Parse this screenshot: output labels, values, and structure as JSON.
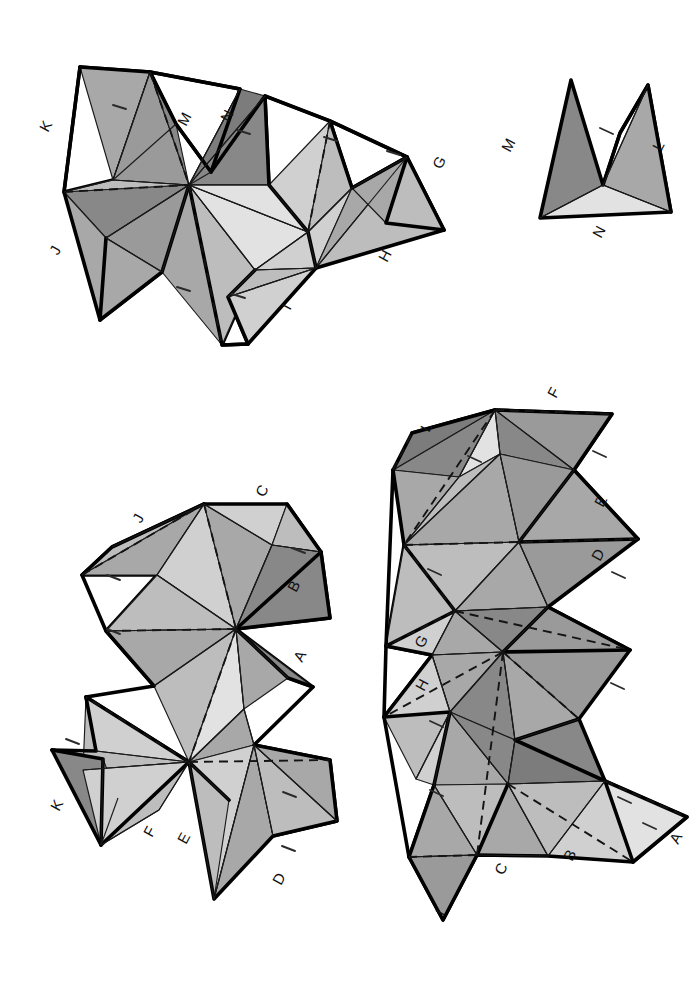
{
  "document": {
    "kind": "polyhedron-net-template",
    "sheet_width": 692,
    "sheet_height": 985,
    "background": "#ffffff",
    "ink": "#000000"
  },
  "palette": {
    "white": "#ffffff",
    "light": "#e2e2e2",
    "light2": "#d0d0d0",
    "mid_light": "#bdbdbd",
    "mid": "#a8a8a8",
    "mid_dark": "#9a9a9a",
    "dark": "#888888",
    "darker": "#7c7c7c",
    "outline": "#000000",
    "thin_line": "#1a1a1a"
  },
  "pieces": [
    {
      "id": "piece-top-left",
      "name": "Large zig-zag net (top left)",
      "labels": [
        "K",
        "M",
        "N",
        "G",
        "J",
        "H",
        "I"
      ]
    },
    {
      "id": "piece-top-right",
      "name": "Small triangular net (top right)",
      "labels": [
        "M",
        "L",
        "N"
      ]
    },
    {
      "id": "piece-bottom-left",
      "name": "Vertical antiprism net (bottom left)",
      "labels": [
        "C",
        "J",
        "B",
        "A",
        "K",
        "F",
        "E",
        "D"
      ]
    },
    {
      "id": "piece-bottom-right",
      "name": "Tall antiprism net (bottom right)",
      "labels": [
        "F",
        "L",
        "E",
        "D",
        "G",
        "H",
        "A",
        "B",
        "C",
        "I"
      ]
    }
  ],
  "labels": {
    "top_left": [
      {
        "text": "K",
        "x": 48,
        "y": 133,
        "rot": -62
      },
      {
        "text": "M",
        "x": 186,
        "y": 127,
        "rot": -62
      },
      {
        "text": "N",
        "x": 229,
        "y": 123,
        "rot": -62
      },
      {
        "text": "G",
        "x": 441,
        "y": 170,
        "rot": -62
      },
      {
        "text": "J",
        "x": 58,
        "y": 256,
        "rot": -62
      },
      {
        "text": "H",
        "x": 387,
        "y": 263,
        "rot": -62
      },
      {
        "text": "I",
        "x": 290,
        "y": 311,
        "rot": -62
      }
    ],
    "top_right": [
      {
        "text": "M",
        "x": 510,
        "y": 153,
        "rot": -62
      },
      {
        "text": "L",
        "x": 661,
        "y": 152,
        "rot": -62
      },
      {
        "text": "N",
        "x": 601,
        "y": 239,
        "rot": -62
      }
    ],
    "bottom_left": [
      {
        "text": "C",
        "x": 264,
        "y": 498,
        "rot": -62
      },
      {
        "text": "J",
        "x": 141,
        "y": 524,
        "rot": -62
      },
      {
        "text": "B",
        "x": 296,
        "y": 593,
        "rot": -62
      },
      {
        "text": "A",
        "x": 302,
        "y": 663,
        "rot": -62
      },
      {
        "text": "K",
        "x": 59,
        "y": 812,
        "rot": -62
      },
      {
        "text": "F",
        "x": 152,
        "y": 838,
        "rot": -62
      },
      {
        "text": "E",
        "x": 186,
        "y": 845,
        "rot": -62
      },
      {
        "text": "D",
        "x": 281,
        "y": 886,
        "rot": -62
      }
    ],
    "bottom_right": [
      {
        "text": "F",
        "x": 556,
        "y": 399,
        "rot": -62
      },
      {
        "text": "L",
        "x": 429,
        "y": 433,
        "rot": -62
      },
      {
        "text": "E",
        "x": 603,
        "y": 508,
        "rot": -62
      },
      {
        "text": "D",
        "x": 600,
        "y": 562,
        "rot": -62
      },
      {
        "text": "G",
        "x": 423,
        "y": 649,
        "rot": -62
      },
      {
        "text": "H",
        "x": 424,
        "y": 692,
        "rot": -62
      },
      {
        "text": "A",
        "x": 678,
        "y": 845,
        "rot": -62
      },
      {
        "text": "B",
        "x": 572,
        "y": 862,
        "rot": -62
      },
      {
        "text": "C",
        "x": 503,
        "y": 876,
        "rot": -62
      },
      {
        "text": "I",
        "x": 444,
        "y": 917,
        "rot": -62
      }
    ]
  },
  "fold_ticks": {
    "description": "short tick marks drawn on glue tabs indicating fold line",
    "top_left": [
      [
        120,
        107
      ],
      [
        243,
        132
      ],
      [
        330,
        139
      ],
      [
        393,
        153
      ],
      [
        183,
        289
      ],
      [
        238,
        296
      ]
    ],
    "top_right": [
      [
        606,
        131
      ]
    ],
    "bottom_left": [
      [
        298,
        551
      ],
      [
        113,
        578
      ],
      [
        113,
        632
      ],
      [
        289,
        795
      ],
      [
        288,
        849
      ],
      [
        72,
        742
      ]
    ],
    "bottom_right": [
      [
        599,
        454
      ],
      [
        474,
        459
      ],
      [
        434,
        572
      ],
      [
        618,
        575
      ],
      [
        617,
        686
      ],
      [
        436,
        724
      ],
      [
        436,
        793
      ],
      [
        624,
        800
      ],
      [
        630,
        826
      ]
    ]
  },
  "faces": {
    "top_left": [
      {
        "name": "tl-f01",
        "fill": "#a8a8a8",
        "pts": "80,67 150,72 113,180"
      },
      {
        "name": "tl-f02",
        "fill": "#bdbdbd",
        "pts": "113,180 150,72 176,124"
      },
      {
        "name": "tl-f03",
        "fill": "#888888",
        "pts": "150,72 189,185 176,124"
      },
      {
        "name": "tl-f04",
        "fill": "#9a9a9a",
        "pts": "150,72 189,185 113,180"
      },
      {
        "name": "tl-f05",
        "fill": "#bdbdbd",
        "pts": "113,180 189,185 64,192"
      },
      {
        "name": "tl-f06",
        "fill": "#888888",
        "pts": "64,192 189,185 106,238"
      },
      {
        "name": "tl-f07",
        "fill": "#a8a8a8",
        "pts": "64,192 106,238 100,320"
      },
      {
        "name": "tl-f08",
        "fill": "#9a9a9a",
        "pts": "106,238 189,185 162,272"
      },
      {
        "name": "tl-f09",
        "fill": "#a8a8a8",
        "pts": "106,238 162,272 100,320"
      },
      {
        "name": "tl-f10",
        "fill": "#a8a8a8",
        "pts": "162,272 189,185 222,345"
      },
      {
        "name": "tl-f11",
        "fill": "#bdbdbd",
        "pts": "189,185 255,270 222,345"
      },
      {
        "name": "tl-f12",
        "fill": "#888888",
        "pts": "189,185 240,89 211,172"
      },
      {
        "name": "tl-f13",
        "fill": "#7c7c7c",
        "pts": "189,185 265,96 240,89"
      },
      {
        "name": "tl-f14",
        "fill": "#888888",
        "pts": "189,185 265,96 269,185"
      },
      {
        "name": "tl-f15",
        "fill": "#bdbdbd",
        "pts": "189,185 269,185 255,270"
      },
      {
        "name": "tl-f16",
        "fill": "#e2e2e2",
        "pts": "189,185 255,270 308,232"
      },
      {
        "name": "tl-f17",
        "fill": "#d0d0d0",
        "pts": "255,270 308,232 316,268"
      },
      {
        "name": "tl-f18",
        "fill": "#e2e2e2",
        "pts": "189,185 308,232 269,185"
      },
      {
        "name": "tl-f19",
        "fill": "#d0d0d0",
        "pts": "269,185 308,232 330,121"
      },
      {
        "name": "tl-f20",
        "fill": "#bdbdbd",
        "pts": "308,232 330,121 352,188"
      },
      {
        "name": "tl-f21",
        "fill": "#d0d0d0",
        "pts": "308,232 352,188 316,268"
      },
      {
        "name": "tl-f22",
        "fill": "#a8a8a8",
        "pts": "316,268 352,188 407,157"
      },
      {
        "name": "tl-f23",
        "fill": "#bdbdbd",
        "pts": "316,268 407,157 444,230"
      },
      {
        "name": "tl-f24",
        "fill": "#a8a8a8",
        "pts": "352,188 407,157 386,223"
      },
      {
        "name": "tl-f25",
        "fill": "#bdbdbd",
        "pts": "255,270 316,268 228,297"
      },
      {
        "name": "tl-f26",
        "fill": "#d0d0d0",
        "pts": "228,297 316,268 248,344"
      }
    ],
    "top_right": [
      {
        "name": "tr-f01",
        "fill": "#888888",
        "pts": "571,80 603,185 540,218"
      },
      {
        "name": "tr-f02",
        "fill": "#a8a8a8",
        "pts": "603,185 648,85 671,212"
      },
      {
        "name": "tr-f03",
        "fill": "#e2e2e2",
        "pts": "540,218 603,185 671,212"
      },
      {
        "name": "tr-f04",
        "fill": "#bdbdbd",
        "pts": "603,185 648,85 620,133"
      }
    ],
    "bottom_left": [
      {
        "name": "bl-f01",
        "fill": "#bdbdbd",
        "pts": "204,504 112,547 82,575"
      },
      {
        "name": "bl-f02",
        "fill": "#a8a8a8",
        "pts": "204,504 82,575 157,575"
      },
      {
        "name": "bl-f03",
        "fill": "#d0d0d0",
        "pts": "204,504 157,575 236,629"
      },
      {
        "name": "bl-f04",
        "fill": "#a8a8a8",
        "pts": "204,504 236,629 272,545"
      },
      {
        "name": "bl-f05",
        "fill": "#d0d0d0",
        "pts": "204,504 272,545 287,504"
      },
      {
        "name": "bl-f06",
        "fill": "#bdbdbd",
        "pts": "272,545 287,504 321,552"
      },
      {
        "name": "bl-f07",
        "fill": "#888888",
        "pts": "272,545 321,552 236,629"
      },
      {
        "name": "bl-f08",
        "fill": "#888888",
        "pts": "236,629 321,552 330,618"
      },
      {
        "name": "bl-f09",
        "fill": "#bdbdbd",
        "pts": "157,575 236,629 106,631"
      },
      {
        "name": "bl-f10",
        "fill": "#a8a8a8",
        "pts": "106,631 236,629 154,686"
      },
      {
        "name": "bl-f11",
        "fill": "#bdbdbd",
        "pts": "154,686 236,629 189,762"
      },
      {
        "name": "bl-f12",
        "fill": "#e2e2e2",
        "pts": "236,629 189,762 244,709"
      },
      {
        "name": "bl-f13",
        "fill": "#a8a8a8",
        "pts": "236,629 244,709 288,678"
      },
      {
        "name": "bl-f14",
        "fill": "#888888",
        "pts": "236,629 288,678 313,687"
      },
      {
        "name": "bl-f15",
        "fill": "#a8a8a8",
        "pts": "189,762 244,709 254,745"
      },
      {
        "name": "bl-f16",
        "fill": "#d0d0d0",
        "pts": "189,762 254,745 189,762"
      },
      {
        "name": "bl-f17",
        "fill": "#bdbdbd",
        "pts": "86,697 189,762 83,770"
      },
      {
        "name": "bl-f18",
        "fill": "#d0d0d0",
        "pts": "86,697 189,762 96,751"
      },
      {
        "name": "bl-f19",
        "fill": "#bdbdbd",
        "pts": "96,751 189,762 83,770"
      },
      {
        "name": "bl-f20",
        "fill": "#888888",
        "pts": "52,750 103,759 101,845"
      },
      {
        "name": "bl-f21",
        "fill": "#a8a8a8",
        "pts": "103,759 101,845 118,798"
      },
      {
        "name": "bl-f22",
        "fill": "#d0d0d0",
        "pts": "83,770 189,762 101,845"
      },
      {
        "name": "bl-f23",
        "fill": "#bdbdbd",
        "pts": "101,845 189,762 159,810"
      },
      {
        "name": "bl-f24",
        "fill": "#d0d0d0",
        "pts": "189,762 254,745 214,899"
      },
      {
        "name": "bl-f25",
        "fill": "#bdbdbd",
        "pts": "189,762 214,899 229,800"
      },
      {
        "name": "bl-f26",
        "fill": "#a8a8a8",
        "pts": "214,899 254,745 273,836"
      },
      {
        "name": "bl-f27",
        "fill": "#bdbdbd",
        "pts": "254,745 273,836 337,821"
      },
      {
        "name": "bl-f28",
        "fill": "#a8a8a8",
        "pts": "254,745 337,821 330,760"
      }
    ],
    "bottom_right": [
      {
        "name": "br-f01",
        "fill": "#9a9a9a",
        "pts": "495,410 612,414 574,470"
      },
      {
        "name": "br-f02",
        "fill": "#888888",
        "pts": "495,410 574,470 500,454"
      },
      {
        "name": "br-f03",
        "fill": "#e2e2e2",
        "pts": "495,410 500,454 459,477"
      },
      {
        "name": "br-f04",
        "fill": "#888888",
        "pts": "495,410 459,477 393,470"
      },
      {
        "name": "br-f05",
        "fill": "#7c7c7c",
        "pts": "393,470 495,410 412,433"
      },
      {
        "name": "br-f06",
        "fill": "#a8a8a8",
        "pts": "393,470 459,477 404,545"
      },
      {
        "name": "br-f07",
        "fill": "#bdbdbd",
        "pts": "459,477 404,545 500,454"
      },
      {
        "name": "br-f08",
        "fill": "#a8a8a8",
        "pts": "500,454 404,545 519,542"
      },
      {
        "name": "br-f09",
        "fill": "#9a9a9a",
        "pts": "500,454 519,542 574,470"
      },
      {
        "name": "br-f10",
        "fill": "#a8a8a8",
        "pts": "574,470 519,542 638,539"
      },
      {
        "name": "br-f11",
        "fill": "#bdbdbd",
        "pts": "404,545 519,542 455,611"
      },
      {
        "name": "br-f12",
        "fill": "#a8a8a8",
        "pts": "519,542 455,611 548,607"
      },
      {
        "name": "br-f13",
        "fill": "#9a9a9a",
        "pts": "519,542 548,607 638,539"
      },
      {
        "name": "br-f14",
        "fill": "#bdbdbd",
        "pts": "404,545 455,611 386,646"
      },
      {
        "name": "br-f15",
        "fill": "#d0d0d0",
        "pts": "386,646 455,611 432,655"
      },
      {
        "name": "br-f16",
        "fill": "#a8a8a8",
        "pts": "432,655 455,611 503,652"
      },
      {
        "name": "br-f17",
        "fill": "#888888",
        "pts": "455,611 503,652 548,607"
      },
      {
        "name": "br-f18",
        "fill": "#9a9a9a",
        "pts": "503,652 548,607 630,650"
      },
      {
        "name": "br-f19",
        "fill": "#a8a8a8",
        "pts": "432,655 503,652 450,712"
      },
      {
        "name": "br-f20",
        "fill": "#d0d0d0",
        "pts": "432,655 450,712 384,717"
      },
      {
        "name": "br-f21",
        "fill": "#888888",
        "pts": "450,712 503,652 515,740"
      },
      {
        "name": "br-f22",
        "fill": "#a8a8a8",
        "pts": "503,652 515,740 579,719"
      },
      {
        "name": "br-f23",
        "fill": "#9a9a9a",
        "pts": "503,652 579,719 630,650"
      },
      {
        "name": "br-f24",
        "fill": "#bdbdbd",
        "pts": "384,717 450,712 416,779"
      },
      {
        "name": "br-f25",
        "fill": "#d0d0d0",
        "pts": "416,779 450,712 434,785"
      },
      {
        "name": "br-f26",
        "fill": "#a8a8a8",
        "pts": "434,785 450,712 508,784"
      },
      {
        "name": "br-f27",
        "fill": "#888888",
        "pts": "450,712 508,784 515,740"
      },
      {
        "name": "br-f28",
        "fill": "#7c7c7c",
        "pts": "515,740 508,784 605,781"
      },
      {
        "name": "br-f29",
        "fill": "#888888",
        "pts": "515,740 605,781 579,719"
      },
      {
        "name": "br-f30",
        "fill": "#bdbdbd",
        "pts": "434,785 508,784 477,855"
      },
      {
        "name": "br-f31",
        "fill": "#a8a8a8",
        "pts": "434,785 477,855 409,857"
      },
      {
        "name": "br-f32",
        "fill": "#9a9a9a",
        "pts": "409,857 477,855 443,920"
      },
      {
        "name": "br-f33",
        "fill": "#a8a8a8",
        "pts": "477,855 443,920 477,855"
      },
      {
        "name": "br-f34",
        "fill": "#a8a8a8",
        "pts": "508,784 477,855 548,856"
      },
      {
        "name": "br-f35",
        "fill": "#bdbdbd",
        "pts": "508,784 548,856 605,781"
      },
      {
        "name": "br-f36",
        "fill": "#d0d0d0",
        "pts": "548,856 605,781 633,862"
      },
      {
        "name": "br-f37",
        "fill": "#e2e2e2",
        "pts": "605,781 633,862 687,817"
      }
    ]
  },
  "tabs": {
    "top_left": [
      "80,67 150,72 113,180 64,192",
      "150,72 240,89 211,172 176,124",
      "265,96 330,121 308,232 269,185",
      "330,121 407,157 352,188",
      "100,320 162,272 189,185 106,238",
      "222,345 255,270 228,297 248,344",
      "444,230 407,157 386,223"
    ],
    "top_right": [
      "648,85 671,212 603,185 620,133"
    ],
    "bottom_left": [
      "204,504 112,547 82,575 157,575",
      "287,504 321,552 272,545",
      "330,618 321,552 272,545 236,629",
      "106,631 157,575 236,629 154,686",
      "313,687 288,678 236,629",
      "52,750 103,759 101,845 83,770",
      "337,821 330,760 254,745 273,836"
    ],
    "bottom_right": [
      "495,410 612,414 574,470 500,454",
      "393,470 495,410 412,433 459,477",
      "638,539 574,470 519,542",
      "386,646 404,545 455,611 432,655",
      "630,650 548,607 503,652",
      "384,717 432,655 450,712",
      "409,857 434,785 477,855 443,920",
      "687,817 605,781 633,862"
    ]
  },
  "fold_lines": {
    "top_left_dashed": [
      "150,72 189,185",
      "64,192 189,185",
      "189,185 222,345",
      "308,232 330,121",
      "255,270 316,268"
    ],
    "top_right_dashed": [],
    "bottom_left_dashed": [
      "204,504 236,629",
      "236,629 106,631",
      "236,629 189,762",
      "189,762 86,697",
      "189,762 330,760",
      "82,575 204,504"
    ],
    "bottom_right_dashed": [
      "495,410 612,414",
      "495,410 404,545",
      "393,470 412,433",
      "404,545 638,539",
      "404,545 455,611",
      "455,611 386,646",
      "455,611 630,650",
      "455,611 503,652",
      "503,652 384,717",
      "503,652 579,719",
      "503,652 477,855",
      "477,855 409,857",
      "605,781 687,817",
      "508,784 633,862"
    ]
  }
}
